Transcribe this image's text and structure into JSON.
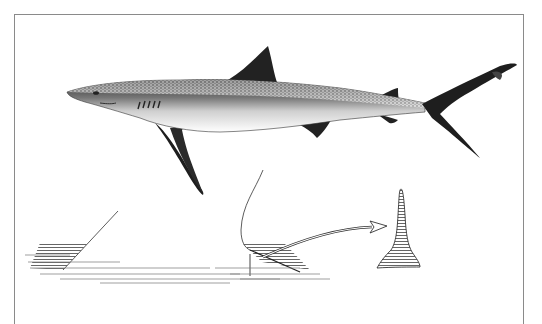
{
  "figure": {
    "parts": [
      "shark-body",
      "dorsal-fin",
      "pectoral-fin",
      "pelvic-fin",
      "anal-fin",
      "second-dorsal-fin",
      "caudal-fin",
      "gill-slits",
      "eye",
      "denticle-cross-section",
      "denticle-enlarged",
      "arrow"
    ]
  },
  "colors": {
    "ink": "#1a1a1a",
    "shade": "#555555",
    "frame": "#8a8a8a",
    "paper": "#ffffff"
  }
}
